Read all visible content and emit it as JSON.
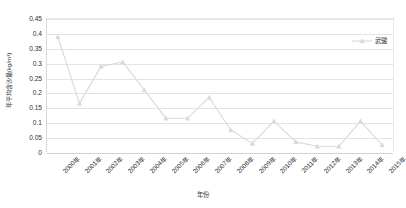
{
  "chart_data": {
    "type": "line",
    "title": "",
    "xlabel": "年份",
    "ylabel": "年平均含沙量(kg/m³)",
    "categories": [
      "2000年",
      "2001年",
      "2002年",
      "2003年",
      "2004年",
      "2005年",
      "2006年",
      "2007年",
      "2008年",
      "2009年",
      "2010年",
      "2011年",
      "2012年",
      "2013年",
      "2014年",
      "2015年"
    ],
    "series": [
      {
        "name": "武骏",
        "color": "#d9d9d9",
        "marker": "triangle",
        "values": [
          0.39,
          0.165,
          0.29,
          0.305,
          0.21,
          0.115,
          0.115,
          0.185,
          0.075,
          0.03,
          0.105,
          0.035,
          0.02,
          0.02,
          0.105,
          0.025
        ]
      }
    ],
    "ylim": [
      0,
      0.45
    ],
    "ytick_step": 0.05,
    "yticks": [
      "0",
      "0.05",
      "0.1",
      "0.15",
      "0.2",
      "0.25",
      "0.3",
      "0.35",
      "0.4",
      "0.45"
    ],
    "grid": true,
    "legend_position": "top-right"
  },
  "legend": {
    "label": "武骏"
  },
  "axes": {
    "x_title": "年份",
    "y_title": "年平均含沙量(kg/m³)"
  }
}
